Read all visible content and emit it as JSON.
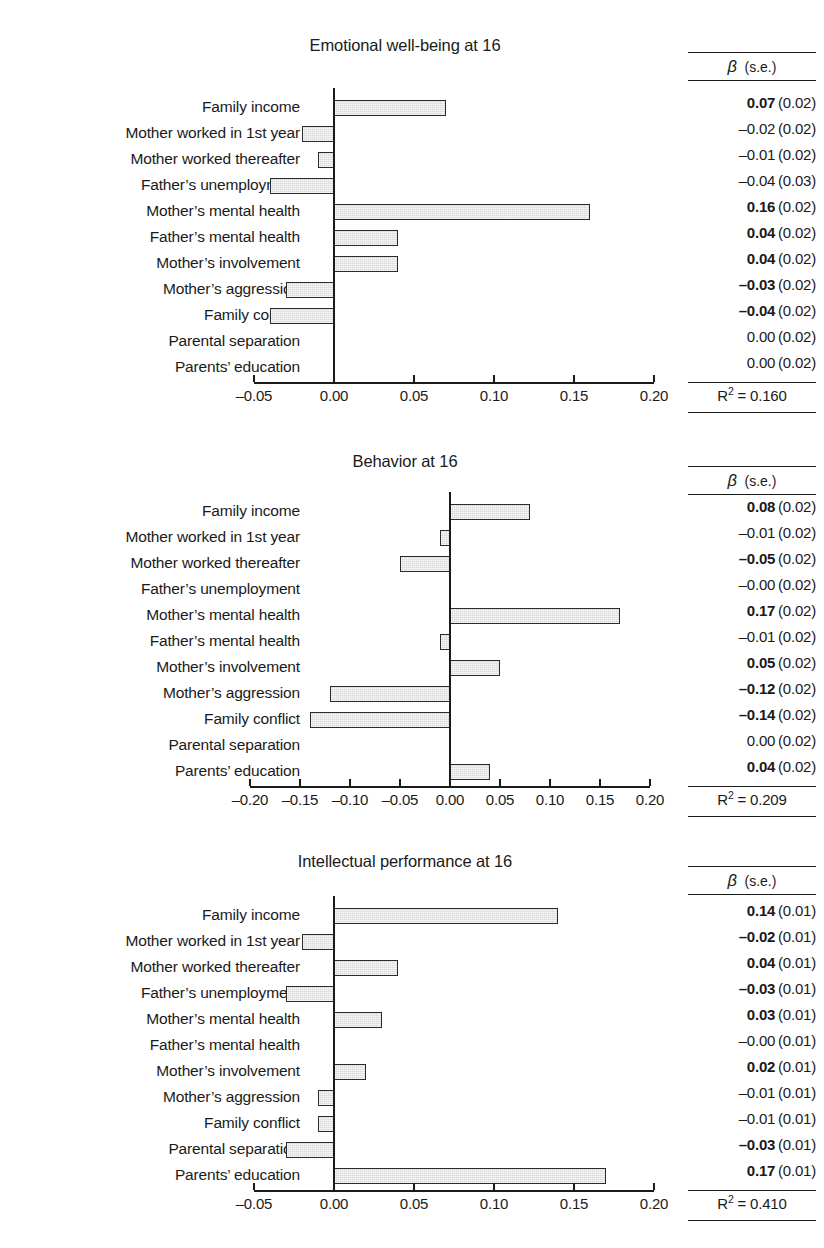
{
  "figure": {
    "predictors": [
      "Family income",
      "Mother worked in 1st year",
      "Mother worked thereafter",
      "Father’s unemployment",
      "Mother’s mental health",
      "Father’s mental health",
      "Mother’s involvement",
      "Mother’s aggression",
      "Family conflict",
      "Parental separation",
      "Parents’ education"
    ],
    "stats_header": {
      "beta": "β",
      "se": "(s.e.)"
    },
    "colors": {
      "bar_fill": "#d9d9d9",
      "bar_border": "#2b2b2b",
      "axis": "#1a1a1a",
      "text": "#1a1a1a",
      "background": "#ffffff"
    }
  },
  "chart_data": [
    {
      "type": "bar",
      "title": "Emotional well-being at 16",
      "orientation": "horizontal",
      "xlabel": "",
      "ylabel": "",
      "xlim": [
        -0.05,
        0.2
      ],
      "xticks": [
        "–0.05",
        "0.00",
        "0.05",
        "0.10",
        "0.15",
        "0.20"
      ],
      "xtick_values": [
        -0.05,
        0.0,
        0.05,
        0.1,
        0.15,
        0.2
      ],
      "grid": false,
      "legend": "none",
      "categories": [
        "Family income",
        "Mother worked in 1st year",
        "Mother worked thereafter",
        "Father’s unemployment",
        "Mother’s mental health",
        "Father’s mental health",
        "Mother’s involvement",
        "Mother’s aggression",
        "Family conflict",
        "Parental separation",
        "Parents’ education"
      ],
      "values": [
        0.07,
        -0.02,
        -0.01,
        -0.04,
        0.16,
        0.04,
        0.04,
        -0.03,
        -0.04,
        0.0,
        0.0
      ],
      "beta_labels": [
        "0.07",
        "–0.02",
        "–0.01",
        "–0.04",
        "0.16",
        "0.04",
        "0.04",
        "–0.03",
        "–0.04",
        "0.00",
        "0.00"
      ],
      "se_labels": [
        "(0.02)",
        "(0.02)",
        "(0.02)",
        "(0.03)",
        "(0.02)",
        "(0.02)",
        "(0.02)",
        "(0.02)",
        "(0.02)",
        "(0.02)",
        "(0.02)"
      ],
      "bold": [
        true,
        false,
        false,
        false,
        true,
        true,
        true,
        true,
        true,
        false,
        false
      ],
      "r2_label": "R",
      "r2_sup": "2",
      "r2_value": "= 0.160"
    },
    {
      "type": "bar",
      "title": "Behavior at 16",
      "orientation": "horizontal",
      "xlabel": "",
      "ylabel": "",
      "xlim": [
        -0.2,
        0.2
      ],
      "xticks": [
        "–0.20",
        "–0.15",
        "–0.10",
        "–0.05",
        "0.00",
        "0.05",
        "0.10",
        "0.15",
        "0.20"
      ],
      "xtick_values": [
        -0.2,
        -0.15,
        -0.1,
        -0.05,
        0.0,
        0.05,
        0.1,
        0.15,
        0.2
      ],
      "grid": false,
      "legend": "none",
      "categories": [
        "Family income",
        "Mother worked in 1st year",
        "Mother worked thereafter",
        "Father’s unemployment",
        "Mother’s mental health",
        "Father’s mental health",
        "Mother’s involvement",
        "Mother’s aggression",
        "Family conflict",
        "Parental separation",
        "Parents’ education"
      ],
      "values": [
        0.08,
        -0.01,
        -0.05,
        0.0,
        0.17,
        -0.01,
        0.05,
        -0.12,
        -0.14,
        0.0,
        0.04
      ],
      "beta_labels": [
        "0.08",
        "–0.01",
        "–0.05",
        "–0.00",
        "0.17",
        "–0.01",
        "0.05",
        "–0.12",
        "–0.14",
        "0.00",
        "0.04"
      ],
      "se_labels": [
        "(0.02)",
        "(0.02)",
        "(0.02)",
        "(0.02)",
        "(0.02)",
        "(0.02)",
        "(0.02)",
        "(0.02)",
        "(0.02)",
        "(0.02)",
        "(0.02)"
      ],
      "bold": [
        true,
        false,
        true,
        false,
        true,
        false,
        true,
        true,
        true,
        false,
        true
      ],
      "r2_label": "R",
      "r2_sup": "2",
      "r2_value": "= 0.209"
    },
    {
      "type": "bar",
      "title": "Intellectual performance at 16",
      "orientation": "horizontal",
      "xlabel": "",
      "ylabel": "",
      "xlim": [
        -0.05,
        0.2
      ],
      "xticks": [
        "–0.05",
        "0.00",
        "0.05",
        "0.10",
        "0.15",
        "0.20"
      ],
      "xtick_values": [
        -0.05,
        0.0,
        0.05,
        0.1,
        0.15,
        0.2
      ],
      "grid": false,
      "legend": "none",
      "categories": [
        "Family income",
        "Mother worked in 1st year",
        "Mother worked thereafter",
        "Father’s unemployment",
        "Mother’s mental health",
        "Father’s mental health",
        "Mother’s involvement",
        "Mother’s aggression",
        "Family conflict",
        "Parental separation",
        "Parents’ education"
      ],
      "values": [
        0.14,
        -0.02,
        0.04,
        -0.03,
        0.03,
        0.0,
        0.02,
        -0.01,
        -0.01,
        -0.03,
        0.17
      ],
      "beta_labels": [
        "0.14",
        "–0.02",
        "0.04",
        "–0.03",
        "0.03",
        "–0.00",
        "0.02",
        "–0.01",
        "–0.01",
        "–0.03",
        "0.17"
      ],
      "se_labels": [
        "(0.01)",
        "(0.01)",
        "(0.01)",
        "(0.01)",
        "(0.01)",
        "(0.01)",
        "(0.01)",
        "(0.01)",
        "(0.01)",
        "(0.01)",
        "(0.01)"
      ],
      "bold": [
        true,
        true,
        true,
        true,
        true,
        false,
        true,
        false,
        false,
        true,
        true
      ],
      "r2_label": "R",
      "r2_sup": "2",
      "r2_value": "= 0.410"
    }
  ]
}
